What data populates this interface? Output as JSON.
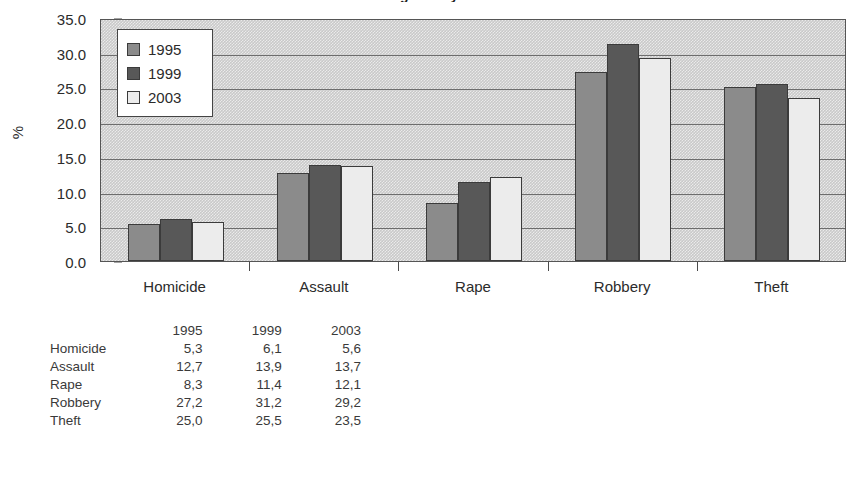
{
  "chart_data": {
    "type": "bar",
    "title": "Crime figures by offence",
    "categories": [
      "Homicide",
      "Assault",
      "Rape",
      "Robbery",
      "Theft"
    ],
    "series": [
      {
        "name": "1995",
        "color": "#8b8b8b",
        "values": [
          5.3,
          12.7,
          8.3,
          27.2,
          25.0
        ]
      },
      {
        "name": "1999",
        "color": "#585858",
        "values": [
          6.1,
          13.9,
          11.4,
          31.2,
          25.5
        ]
      },
      {
        "name": "2003",
        "color": "#ececec",
        "values": [
          5.6,
          13.7,
          12.1,
          29.2,
          23.5
        ]
      }
    ],
    "xlabel": "",
    "ylabel": "%",
    "ylim": [
      0,
      35
    ],
    "ytick_step": 5,
    "ytick_labels": [
      "0.0",
      "5.0",
      "10.0",
      "15.0",
      "20.0",
      "25.0",
      "30.0",
      "35.0"
    ],
    "grid": true,
    "legend_position": "top-left-inside",
    "legend_entries": [
      "1995",
      "1999",
      "2003"
    ]
  },
  "table": {
    "header": [
      "",
      "1995",
      "1999",
      "2003"
    ],
    "rows": [
      {
        "label": "Homicide",
        "values": [
          "5,3",
          "6,1",
          "5,6"
        ]
      },
      {
        "label": "Assault",
        "values": [
          "12,7",
          "13,9",
          "13,7"
        ]
      },
      {
        "label": "Rape",
        "values": [
          "8,3",
          "11,4",
          "12,1"
        ]
      },
      {
        "label": "Robbery",
        "values": [
          "27,2",
          "31,2",
          "29,2"
        ]
      },
      {
        "label": "Theft",
        "values": [
          "25,0",
          "25,5",
          "23,5"
        ]
      }
    ]
  }
}
